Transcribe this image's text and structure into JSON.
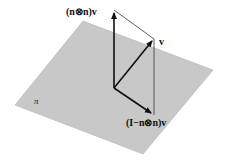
{
  "diagram": {
    "plane": {
      "label": "π",
      "color": "#c8c8c8",
      "corners": [
        [
          15,
          105
        ],
        [
          83,
          21
        ],
        [
          213,
          70
        ],
        [
          143,
          154
        ]
      ]
    },
    "origin": [
      114,
      88
    ],
    "vectors": [
      {
        "name": "v",
        "label": "v",
        "tip": [
          154,
          39
        ]
      },
      {
        "name": "normal-component",
        "label": "(n⊗n)v",
        "tip": [
          114,
          10
        ]
      },
      {
        "name": "projection",
        "label": "(I−n⊗n)v",
        "tip": [
          154,
          115
        ]
      }
    ],
    "colors": {
      "arrow": "#111111",
      "guide": "#333333"
    }
  }
}
